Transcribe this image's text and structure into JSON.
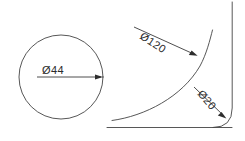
{
  "drawing": {
    "title": "Technical Drawing",
    "background_color": "#ffffff",
    "line_color": "#444444",
    "text_color": "#2b2b2b",
    "width": 245,
    "height": 141
  },
  "views": {
    "left_view": {
      "name": "circle-view",
      "circle": {
        "center_x": 61,
        "center_y": 77,
        "radius": 42
      },
      "dimension": {
        "label": "Ø44",
        "value": 44,
        "symbol": "Ø",
        "number": "44",
        "text_x": 42,
        "text_y": 74,
        "line_start_x": 37,
        "line_end_x": 102,
        "line_y": 77,
        "rotation": 0
      }
    },
    "right_view": {
      "name": "flared-profile-view",
      "dimensions": [
        {
          "label": "Ø120",
          "value": 120,
          "symbol": "Ø",
          "number": "120",
          "text_x": 139,
          "text_y": 38,
          "rotation": 33,
          "leader_start_x": 134,
          "leader_start_y": 27,
          "leader_end_x": 197,
          "leader_end_y": 56
        },
        {
          "label": "Ø20",
          "value": 20,
          "symbol": "Ø",
          "number": "20",
          "text_x": 197,
          "text_y": 94,
          "rotation": 50,
          "leader_start_x": 194,
          "leader_start_y": 87,
          "leader_end_x": 226,
          "leader_end_y": 118
        }
      ]
    }
  }
}
